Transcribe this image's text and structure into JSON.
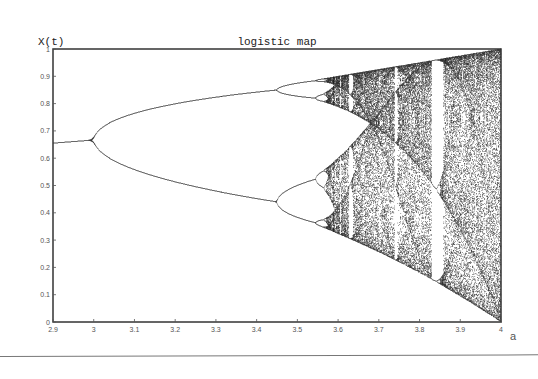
{
  "chart_data": {
    "type": "scatter",
    "title": "logistic map",
    "xlabel": "a",
    "ylabel": "X(t)",
    "xlim": [
      2.9,
      4.0
    ],
    "ylim": [
      0,
      1
    ],
    "x_ticks": [
      "2.9",
      "3",
      "3.1",
      "3.2",
      "3.3",
      "3.4",
      "3.5",
      "3.6",
      "3.7",
      "3.8",
      "3.9",
      "4"
    ],
    "y_ticks": [
      "0",
      "0.1",
      "0.2",
      "0.3",
      "0.4",
      "0.5",
      "0.6",
      "0.7",
      "0.8",
      "0.9",
      "1"
    ],
    "grid": false,
    "legend": null,
    "series": [
      {
        "name": "x_{t+1} = a x_t (1 - x_t)",
        "description": "bifurcation diagram: steady-state values of X(t) for each a",
        "a_start": 2.9,
        "a_end": 4.0,
        "a_steps": 900,
        "transient_iterations": 300,
        "plotted_iterations": 120,
        "x0": 0.5
      }
    ],
    "annotations": {
      "fixed_point_at_2.9": 0.655,
      "first_bifurcation_a": 3.0,
      "fixed_point_at_3.0": 0.667,
      "second_bifurcation_a": 3.449,
      "period2_branches_at_3.449": [
        0.44,
        0.852
      ],
      "onset_of_chaos_a": 3.57,
      "period3_window_a": [
        3.828,
        3.857
      ]
    },
    "colors": {
      "points": "#111111",
      "axes": "#333333",
      "background": "#ffffff"
    }
  }
}
